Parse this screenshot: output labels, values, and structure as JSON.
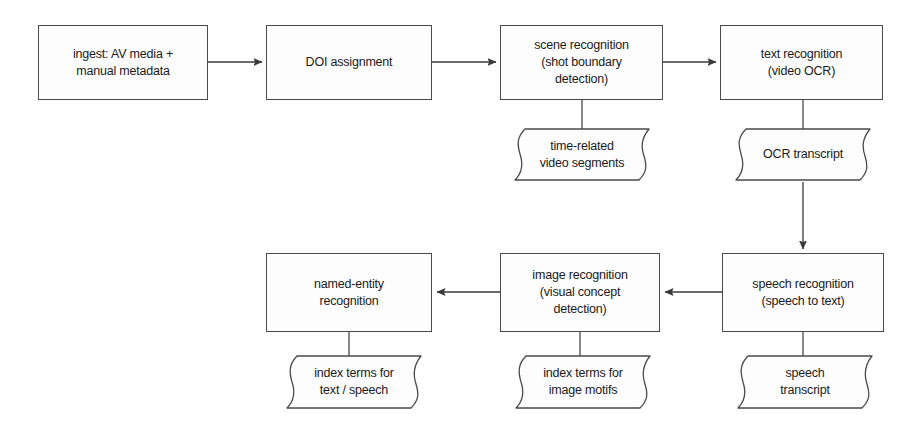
{
  "diagram": {
    "stroke_color": "#4a4a4a",
    "text_color": "#1a1a1a",
    "background_color": "#ffffff",
    "nodes": [
      {
        "id": "ingest",
        "shape": "process",
        "label": "ingest: AV media +\nmanual metadata",
        "x": 38,
        "y": 25,
        "w": 170,
        "h": 75
      },
      {
        "id": "doi",
        "shape": "process",
        "label": "DOI assignment",
        "x": 266,
        "y": 25,
        "w": 166,
        "h": 75
      },
      {
        "id": "scene",
        "shape": "process",
        "label": "scene recognition\n(shot boundary\ndetection)",
        "x": 500,
        "y": 25,
        "w": 163,
        "h": 75
      },
      {
        "id": "text",
        "shape": "process",
        "label": "text recognition\n(video OCR)",
        "x": 720,
        "y": 25,
        "w": 163,
        "h": 75
      },
      {
        "id": "video-segments",
        "shape": "document",
        "label": "time-related\nvideo segments",
        "x": 513,
        "y": 127,
        "w": 138,
        "h": 55
      },
      {
        "id": "ocr-transcript",
        "shape": "document",
        "label": "OCR transcript",
        "x": 734,
        "y": 127,
        "w": 138,
        "h": 55
      },
      {
        "id": "named-entity",
        "shape": "process",
        "label": "named-entity\nrecognition",
        "x": 266,
        "y": 253,
        "w": 166,
        "h": 79
      },
      {
        "id": "image-recognition",
        "shape": "process",
        "label": "image recognition\n(visual concept\ndetection)",
        "x": 500,
        "y": 253,
        "w": 160,
        "h": 79
      },
      {
        "id": "speech-recognition",
        "shape": "process",
        "label": "speech recognition\n(speech to text)",
        "x": 722,
        "y": 253,
        "w": 162,
        "h": 79
      },
      {
        "id": "index-text-speech",
        "shape": "document",
        "label": "index terms for\ntext / speech",
        "x": 285,
        "y": 354,
        "w": 138,
        "h": 56
      },
      {
        "id": "index-image-motifs",
        "shape": "document",
        "label": "index terms for\nimage motifs",
        "x": 514,
        "y": 354,
        "w": 138,
        "h": 56
      },
      {
        "id": "speech-transcript",
        "shape": "document",
        "label": "speech\ntranscript",
        "x": 736,
        "y": 354,
        "w": 138,
        "h": 56
      }
    ],
    "connectors": [
      {
        "id": "ingest-to-doi",
        "kind": "arrow",
        "from": "ingest",
        "to": "doi",
        "direction": "right"
      },
      {
        "id": "doi-to-scene",
        "kind": "arrow",
        "from": "doi",
        "to": "scene",
        "direction": "right"
      },
      {
        "id": "scene-to-text",
        "kind": "arrow",
        "from": "scene",
        "to": "text",
        "direction": "right"
      },
      {
        "id": "scene-to-video-segments",
        "kind": "line",
        "from": "scene",
        "to": "video-segments",
        "direction": "down"
      },
      {
        "id": "text-to-ocr-transcript",
        "kind": "line",
        "from": "text",
        "to": "ocr-transcript",
        "direction": "down"
      },
      {
        "id": "ocr-to-speech",
        "kind": "arrow",
        "from": "ocr-transcript",
        "to": "speech-recognition",
        "direction": "down"
      },
      {
        "id": "speech-to-image",
        "kind": "arrow",
        "from": "speech-recognition",
        "to": "image-recognition",
        "direction": "left"
      },
      {
        "id": "image-to-named-entity",
        "kind": "arrow",
        "from": "image-recognition",
        "to": "named-entity",
        "direction": "left"
      },
      {
        "id": "named-entity-to-index",
        "kind": "line",
        "from": "named-entity",
        "to": "index-text-speech",
        "direction": "down"
      },
      {
        "id": "image-to-index",
        "kind": "line",
        "from": "image-recognition",
        "to": "index-image-motifs",
        "direction": "down"
      },
      {
        "id": "speech-to-transcript",
        "kind": "line",
        "from": "speech-recognition",
        "to": "speech-transcript",
        "direction": "down"
      }
    ]
  }
}
